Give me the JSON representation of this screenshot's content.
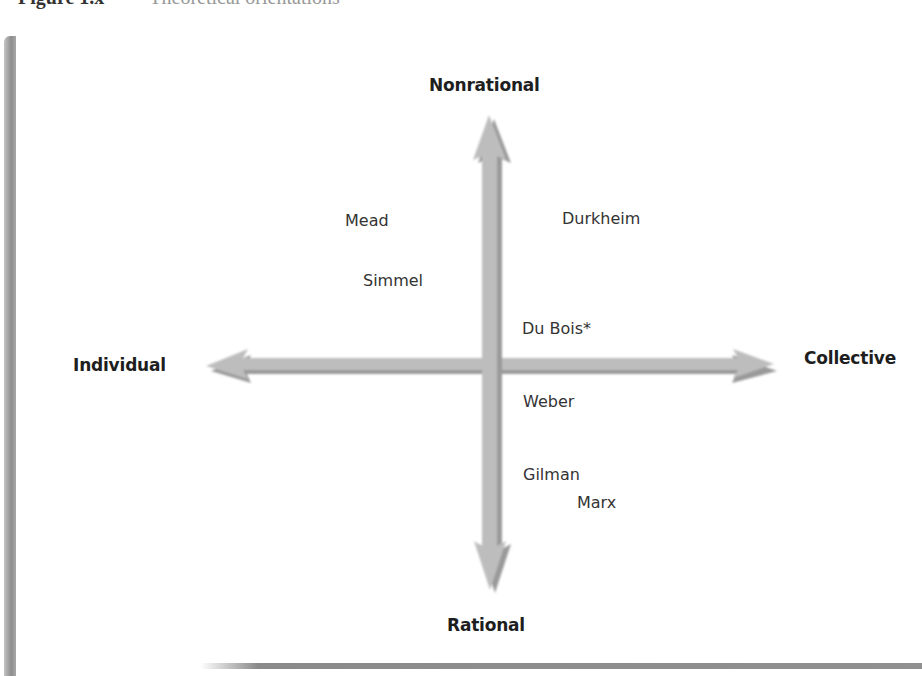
{
  "caption": {
    "number": "Figure 1.x",
    "title": "Theoretical orientations"
  },
  "diagram": {
    "axes": {
      "top": "Nonrational",
      "bottom": "Rational",
      "left": "Individual",
      "right": "Collective"
    },
    "colors": {
      "arrow_fill": "#bdbdbd",
      "arrow_shadow": "#8f8f8f",
      "border": "#909090",
      "text": "#222222"
    },
    "theorists": [
      {
        "name": "Mead",
        "quadrant": "individual-nonrational"
      },
      {
        "name": "Simmel",
        "quadrant": "individual-nonrational"
      },
      {
        "name": "Durkheim",
        "quadrant": "collective-nonrational"
      },
      {
        "name": "Du Bois*",
        "quadrant": "collective-nonrational"
      },
      {
        "name": "Weber",
        "quadrant": "collective-rational"
      },
      {
        "name": "Gilman",
        "quadrant": "collective-rational"
      },
      {
        "name": "Marx",
        "quadrant": "collective-rational"
      }
    ]
  }
}
